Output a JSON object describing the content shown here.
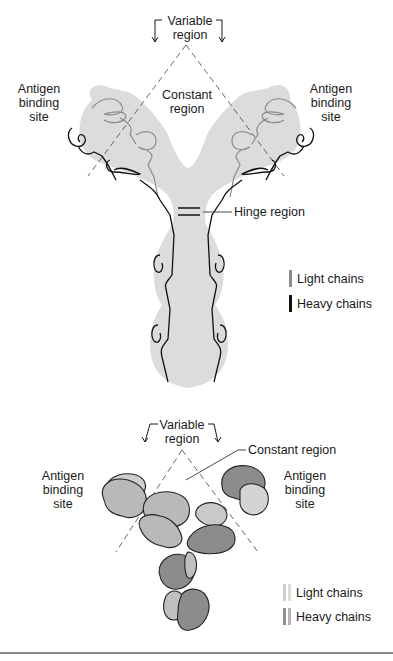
{
  "top_diagram": {
    "variable_region": "Variable\nregion",
    "variable_line1": "Variable",
    "variable_line2": "region",
    "constant_region_line1": "Constant",
    "constant_region_line2": "region",
    "antigen_left": [
      "Antigen",
      "binding",
      "site"
    ],
    "antigen_right": [
      "Antigen",
      "binding",
      "site"
    ],
    "hinge_region": "Hinge region",
    "legend": [
      {
        "label": "Light chains",
        "color": "#8c8c8c"
      },
      {
        "label": "Heavy chains",
        "color": "#111111"
      }
    ],
    "body_fill": "#dcdcdc"
  },
  "bottom_diagram": {
    "variable_line1": "Variable",
    "variable_line2": "region",
    "constant_region": "Constant region",
    "antigen_left": [
      "Antigen",
      "binding",
      "site"
    ],
    "antigen_right": [
      "Antigen",
      "binding",
      "site"
    ],
    "legend": [
      {
        "label": "Light chains",
        "color": "#cfcfcf"
      },
      {
        "label": "Heavy chains",
        "color": "#8f8f8f"
      }
    ],
    "light_fill": "#c7c7c7",
    "heavy_fill": "#8c8c8c"
  }
}
